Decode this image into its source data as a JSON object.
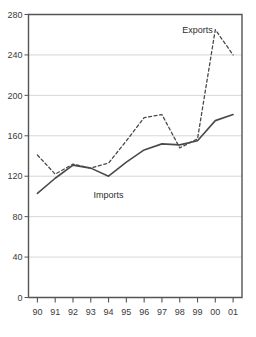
{
  "chart_data": {
    "type": "line",
    "title": "",
    "subtitle": "",
    "xlabel": "",
    "ylabel": "",
    "x": [
      "90",
      "91",
      "92",
      "93",
      "94",
      "95",
      "96",
      "97",
      "98",
      "99",
      "00",
      "01"
    ],
    "categories": [
      "90",
      "91",
      "92",
      "93",
      "94",
      "95",
      "96",
      "97",
      "98",
      "99",
      "00",
      "01"
    ],
    "series": [
      {
        "name": "Exports",
        "style": "dashed",
        "color": "#4a4a4a",
        "values": [
          141,
          122,
          132,
          128,
          133,
          155,
          178,
          181,
          148,
          157,
          265,
          240
        ]
      },
      {
        "name": "Imports",
        "style": "solid",
        "color": "#4a4a4a",
        "values": [
          103,
          118,
          131,
          128,
          120,
          134,
          146,
          152,
          151,
          155,
          175,
          181
        ]
      }
    ],
    "annotations": [
      {
        "text": "Exports",
        "x": "99",
        "y": 262
      },
      {
        "text": "Imports",
        "x": "94",
        "y": 98
      }
    ],
    "ylim": [
      0,
      280
    ],
    "yticks": [
      0,
      40,
      80,
      120,
      160,
      200,
      240,
      280
    ],
    "ytick_labels": [
      "0",
      "40",
      "80",
      "120",
      "160",
      "200",
      "240",
      "280"
    ],
    "xtick_labels": [
      "90",
      "91",
      "92",
      "93",
      "94",
      "95",
      "96",
      "97",
      "98",
      "99",
      "00",
      "01"
    ],
    "grid": true,
    "grid_axis": "y",
    "grid_color": "#cccccc",
    "legend_position": "inline-annotation",
    "plot_border_color": "#555555",
    "background": "#ffffff"
  }
}
